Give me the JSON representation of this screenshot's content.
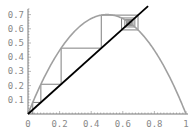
{
  "chart_data": {
    "type": "line",
    "title": "",
    "xlabel": "",
    "ylabel": "",
    "xlim": [
      0,
      1
    ],
    "ylim": [
      0,
      0.75
    ],
    "grid": false,
    "x_ticks": [
      "0",
      "0.2",
      "0.4",
      "0.6",
      "0.8",
      "1"
    ],
    "y_ticks": [
      "0.1",
      "0.2",
      "0.3",
      "0.4",
      "0.5",
      "0.6",
      "0.7"
    ],
    "series": [
      {
        "name": "logistic map f(x)=2.8x(1-x)",
        "r": 2.8,
        "color": "#a0a0a0",
        "domain": [
          0,
          1
        ]
      },
      {
        "name": "diagonal y=x",
        "color": "#000000",
        "domain": [
          0,
          0.76
        ]
      },
      {
        "name": "cobweb iteration",
        "color": "#707070",
        "x0": 0.03,
        "iterations": 40
      }
    ],
    "fixed_point": 0.643
  }
}
